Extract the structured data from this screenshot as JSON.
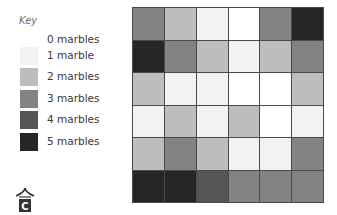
{
  "legend": {
    "title": "Key",
    "items": [
      {
        "label": "0 marbles",
        "value": 0,
        "color": "#ffffff"
      },
      {
        "label": "1 marble",
        "value": 1,
        "color": "#f2f2f2"
      },
      {
        "label": "2 marbles",
        "value": 2,
        "color": "#bdbdbd"
      },
      {
        "label": "3 marbles",
        "value": 3,
        "color": "#838383"
      },
      {
        "label": "4 marbles",
        "value": 4,
        "color": "#555555"
      },
      {
        "label": "5 marbles",
        "value": 5,
        "color": "#262626"
      }
    ]
  },
  "chart_data": {
    "type": "heatmap",
    "title": "",
    "legend_title": "Key",
    "legend_entries": [
      "0 marbles",
      "1 marble",
      "2 marbles",
      "3 marbles",
      "4 marbles",
      "5 marbles"
    ],
    "legend_position": "left",
    "rows": 6,
    "cols": 6,
    "values": [
      [
        3,
        2,
        1,
        0,
        3,
        5
      ],
      [
        5,
        3,
        2,
        1,
        2,
        3
      ],
      [
        2,
        1,
        1,
        0,
        0,
        2
      ],
      [
        1,
        2,
        1,
        2,
        0,
        1
      ],
      [
        2,
        3,
        2,
        1,
        1,
        3
      ],
      [
        5,
        5,
        4,
        3,
        3,
        3
      ]
    ],
    "color_scale": {
      "0": "#ffffff",
      "1": "#f2f2f2",
      "2": "#bdbdbd",
      "3": "#838383",
      "4": "#555555",
      "5": "#262626"
    }
  },
  "logo": {
    "letter": "C"
  }
}
